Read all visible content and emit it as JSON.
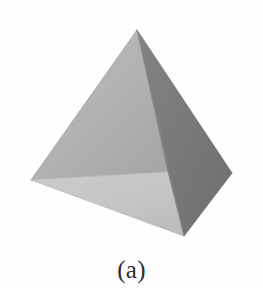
{
  "figure": {
    "caption": "(a)",
    "alt_description": "Shaded tetrahedron (triangular pyramid) in grayscale",
    "background_color": "#fefefe"
  },
  "solid": {
    "name": "tetrahedron",
    "vertex_count_visible": 4,
    "face_count_visible": 3,
    "vertices": {
      "apex": {
        "x": 137,
        "y": 30
      },
      "left": {
        "x": 31,
        "y": 180
      },
      "right": {
        "x": 232,
        "y": 173
      },
      "front_bottom": {
        "x": 184,
        "y": 236
      },
      "interior_junction": {
        "x": 168,
        "y": 172
      }
    },
    "faces": [
      {
        "name": "left-face",
        "fill": "#b3b3b3",
        "points": "137,30 31,180 168,172"
      },
      {
        "name": "right-face",
        "fill": "#7a7a7a",
        "points": "137,30 232,173 184,236 168,172"
      },
      {
        "name": "bottom-face",
        "fill": "#c6c6c6",
        "points": "31,180 168,172 184,236"
      }
    ],
    "edges": [
      {
        "name": "apex-to-left-edge",
        "x1": 137,
        "y1": 30,
        "x2": 31,
        "y2": 180,
        "stroke": "#9a9a9a"
      },
      {
        "name": "apex-to-right-edge",
        "x1": 137,
        "y1": 30,
        "x2": 232,
        "y2": 173,
        "stroke": "#6d6d6d"
      },
      {
        "name": "apex-to-front-edge",
        "x1": 137,
        "y1": 30,
        "x2": 184,
        "y2": 236,
        "stroke": "#8f8f8f"
      },
      {
        "name": "left-to-front-edge",
        "x1": 31,
        "y1": 180,
        "x2": 184,
        "y2": 236,
        "stroke": "#b0b0b0"
      },
      {
        "name": "left-to-junction-edge",
        "x1": 31,
        "y1": 180,
        "x2": 168,
        "y2": 172,
        "stroke": "#a8a8a8"
      },
      {
        "name": "right-to-front-edge",
        "x1": 232,
        "y1": 173,
        "x2": 184,
        "y2": 236,
        "stroke": "#6a6a6a"
      }
    ]
  }
}
